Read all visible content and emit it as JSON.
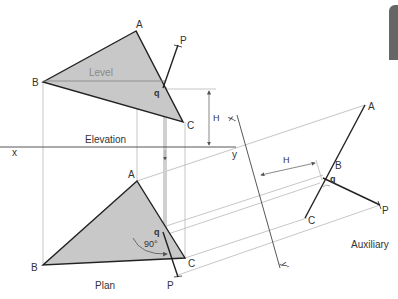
{
  "diagram": {
    "views": {
      "elevation": {
        "label": "Elevation",
        "level_label": "Level"
      },
      "plan": {
        "label": "Plan",
        "angle_label": "90°"
      },
      "auxiliary": {
        "label": "Auxiliary"
      }
    },
    "points": {
      "A": "A",
      "B": "B",
      "C": "C",
      "P": "P",
      "q": "q"
    },
    "reference_line": {
      "x": "x",
      "y": "y",
      "x_prime": "x'",
      "y_prime": "y'"
    },
    "dimension": {
      "H": "H"
    },
    "colors": {
      "fill": "#c8c8c8",
      "edge": "#222222",
      "construction": "#b5b5b5",
      "text": "#333333",
      "tab": "#666666"
    }
  }
}
